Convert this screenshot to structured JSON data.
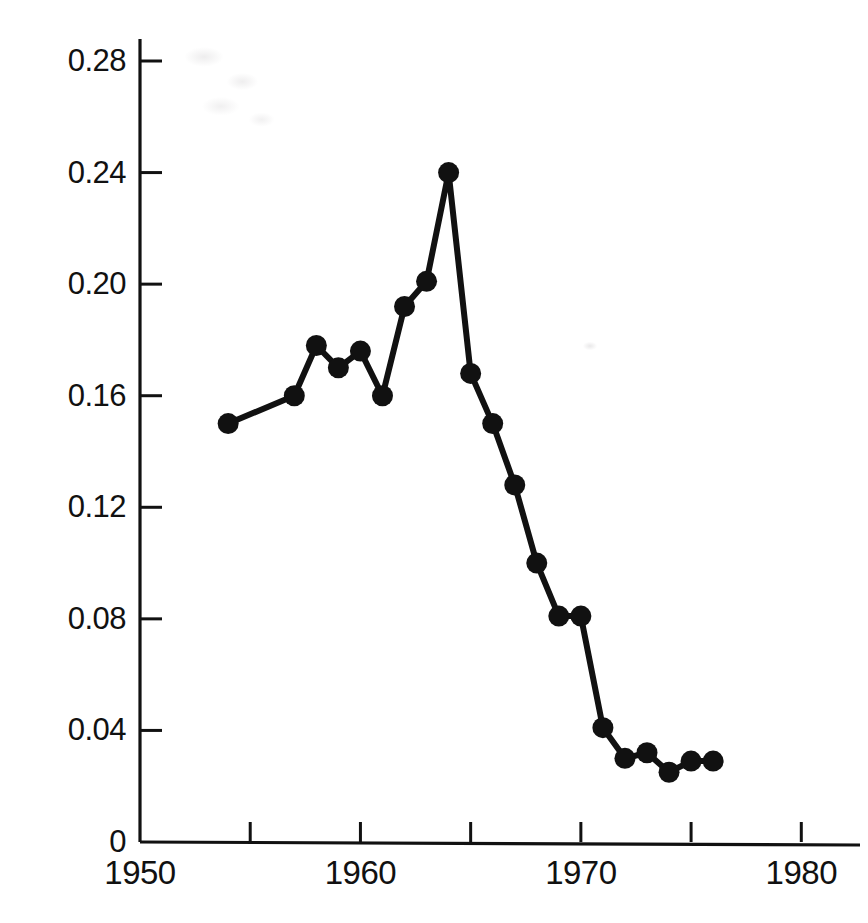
{
  "chart_data": {
    "type": "line",
    "title": "",
    "subtitle": "",
    "xlabel": "",
    "ylabel": "Concentration (ppm)",
    "xlim": [
      1950,
      1980
    ],
    "ylim": [
      0,
      0.3
    ],
    "grid": false,
    "legend": null,
    "marker": "filled-circle",
    "line_color": "#111111",
    "marker_color": "#111111",
    "x_ticks": [
      1950,
      1955,
      1960,
      1965,
      1970,
      1975,
      1980
    ],
    "x_tick_labels": [
      "1950",
      "",
      "1960",
      "",
      "1970",
      "",
      "1980"
    ],
    "y_ticks": [
      0,
      0.04,
      0.08,
      0.12,
      0.16,
      0.2,
      0.24,
      0.28
    ],
    "y_tick_labels": [
      "0",
      "0.04",
      "0.08",
      "0.12",
      "0.16",
      "0.20",
      "0.24",
      "0.28"
    ],
    "x": [
      1954,
      1957,
      1958,
      1959,
      1960,
      1961,
      1962,
      1963,
      1964,
      1965,
      1966,
      1967,
      1968,
      1969,
      1970,
      1971,
      1972,
      1973,
      1974,
      1975,
      1976
    ],
    "values": [
      0.15,
      0.16,
      0.178,
      0.17,
      0.176,
      0.16,
      0.192,
      0.201,
      0.24,
      0.168,
      0.15,
      0.128,
      0.1,
      0.081,
      0.081,
      0.041,
      0.03,
      0.032,
      0.025,
      0.029,
      0.029
    ],
    "points": [
      {
        "x": 1954,
        "y": 0.15
      },
      {
        "x": 1957,
        "y": 0.16
      },
      {
        "x": 1958,
        "y": 0.178
      },
      {
        "x": 1959,
        "y": 0.17
      },
      {
        "x": 1960,
        "y": 0.176
      },
      {
        "x": 1961,
        "y": 0.16
      },
      {
        "x": 1962,
        "y": 0.192
      },
      {
        "x": 1963,
        "y": 0.201
      },
      {
        "x": 1964,
        "y": 0.24
      },
      {
        "x": 1965,
        "y": 0.168
      },
      {
        "x": 1966,
        "y": 0.15
      },
      {
        "x": 1967,
        "y": 0.128
      },
      {
        "x": 1968,
        "y": 0.1
      },
      {
        "x": 1969,
        "y": 0.081
      },
      {
        "x": 1970,
        "y": 0.081
      },
      {
        "x": 1971,
        "y": 0.041
      },
      {
        "x": 1972,
        "y": 0.03
      },
      {
        "x": 1973,
        "y": 0.032
      },
      {
        "x": 1974,
        "y": 0.025
      },
      {
        "x": 1975,
        "y": 0.029
      },
      {
        "x": 1976,
        "y": 0.029
      }
    ]
  },
  "axes": {
    "y_axis_label": "Concentration (ppm)",
    "y_tick_labels": [
      "0.28",
      "0.24",
      "0.20",
      "0.16",
      "0.12",
      "0.08",
      "0.04",
      "0"
    ],
    "x_tick_labels": [
      "1950",
      "1960",
      "1970",
      "1980"
    ]
  }
}
